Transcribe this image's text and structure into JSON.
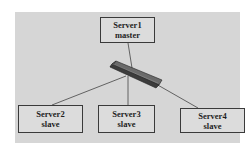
{
  "diagram": {
    "type": "network-topology",
    "background_color": "#d6d6d6",
    "hub": {
      "label": "",
      "shape": "switch-bar",
      "color": "#4a4a4a"
    },
    "nodes": [
      {
        "id": "server1",
        "name": "Server1",
        "role": "master"
      },
      {
        "id": "server2",
        "name": "Server2",
        "role": "slave"
      },
      {
        "id": "server3",
        "name": "Server3",
        "role": "slave"
      },
      {
        "id": "server4",
        "name": "Server4",
        "role": "slave"
      }
    ],
    "edges": [
      {
        "from": "server1",
        "to": "hub"
      },
      {
        "from": "hub",
        "to": "server2"
      },
      {
        "from": "hub",
        "to": "server3"
      },
      {
        "from": "hub",
        "to": "server4"
      }
    ]
  }
}
